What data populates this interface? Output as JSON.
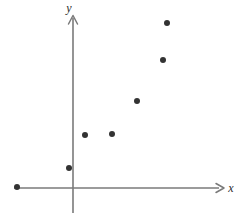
{
  "figure": {
    "width": 247,
    "height": 219,
    "background_color": "#ffffff"
  },
  "axes": {
    "x_axis": {
      "label": "x",
      "label_position": {
        "x": 231,
        "y": 192
      },
      "line": {
        "x1": 14,
        "y1": 188,
        "x2": 219,
        "y2": 188
      },
      "arrow_head": {
        "x": 224,
        "y": 188
      },
      "color": "#7a7a7a"
    },
    "y_axis": {
      "label": "y",
      "label_position": {
        "x": 69,
        "y": 12
      },
      "line": {
        "x1": 73,
        "y1": 213,
        "x2": 73,
        "y2": 18
      },
      "arrow_head": {
        "x": 73,
        "y": 15
      },
      "color": "#7a7a7a"
    },
    "origin": {
      "x": 73,
      "y": 188
    }
  },
  "chart_data": {
    "type": "scatter",
    "title": "",
    "xlabel": "x",
    "ylabel": "y",
    "grid": false,
    "legend": false,
    "point_color": "#333333",
    "point_radius": 3,
    "axis_ranges_note": "Axes are unlabeled with no tick marks or numeric scale.",
    "pixel_points": [
      {
        "px": 17,
        "py": 187
      },
      {
        "px": 69,
        "py": 168
      },
      {
        "px": 85,
        "py": 135
      },
      {
        "px": 112,
        "py": 134
      },
      {
        "px": 137,
        "py": 101
      },
      {
        "px": 163,
        "py": 60
      },
      {
        "px": 167,
        "py": 23
      }
    ],
    "x": [
      -1.2,
      -0.1,
      0.3,
      0.9,
      1.4,
      2.0,
      2.1
    ],
    "y": [
      0.02,
      0.4,
      1.1,
      1.1,
      1.8,
      2.6,
      3.4
    ],
    "n_points": 7
  }
}
